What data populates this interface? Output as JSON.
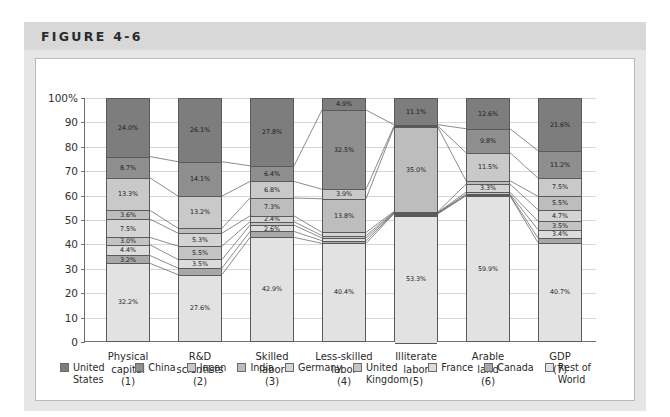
{
  "figure": {
    "title": "FIGURE 4-6"
  },
  "chart_data": {
    "type": "bar",
    "subtype": "stacked-100-percent",
    "title": "FIGURE 4-6",
    "xlabel": "",
    "ylabel": "",
    "ylim": [
      0,
      100
    ],
    "yticks": [
      "0",
      "10",
      "20",
      "30",
      "40",
      "50",
      "60",
      "70",
      "80",
      "90",
      "100%"
    ],
    "grid": true,
    "legend_position": "bottom",
    "legend": [
      "United States",
      "China",
      "Japan",
      "India",
      "Germany",
      "United Kingdom",
      "France",
      "Canada",
      "Rest of World"
    ],
    "categories": [
      "Physical capital\n(1)",
      "R&D scientists\n(2)",
      "Skilled labor\n(3)",
      "Less-skilled labor\n(4)",
      "Illiterate labor\n(5)",
      "Arable land\n(6)",
      "GDP\n(7)"
    ],
    "category_labels": [
      {
        "line1": "Physical",
        "line2": "capital",
        "num": "(1)"
      },
      {
        "line1": "R&D",
        "line2": "scientists",
        "num": "(2)"
      },
      {
        "line1": "Skilled",
        "line2": "labor",
        "num": "(3)"
      },
      {
        "line1": "Less-skilled",
        "line2": "labor",
        "num": "(4)"
      },
      {
        "line1": "Illiterate",
        "line2": "labor",
        "num": "(5)"
      },
      {
        "line1": "Arable",
        "line2": "land",
        "num": "(6)"
      },
      {
        "line1": "GDP",
        "line2": "",
        "num": "(7)"
      }
    ],
    "series": [
      {
        "name": "United States",
        "color": "#7d7d7d",
        "values": [
          24.0,
          26.1,
          27.8,
          4.9,
          11.1,
          12.6,
          21.6
        ],
        "labels": [
          "24.0%",
          "26.1%",
          "27.8%",
          "4.9%",
          "11.1%",
          "12.6%",
          "21.6%"
        ]
      },
      {
        "name": "China",
        "color": "#8f8f8f",
        "values": [
          8.7,
          14.1,
          6.4,
          32.5,
          0.6,
          9.8,
          11.2
        ],
        "labels": [
          "8.7%",
          "14.1%",
          "6.4%",
          "32.5%",
          "",
          "9.8%",
          "11.2%"
        ]
      },
      {
        "name": "Japan",
        "color": "#c9c9c9",
        "values": [
          13.3,
          13.2,
          6.8,
          3.9,
          0.5,
          11.5,
          7.5
        ],
        "labels": [
          "13.3%",
          "13.2%",
          "6.8%",
          "3.9%",
          "",
          "11.5%",
          "7.5%"
        ]
      },
      {
        "name": "India",
        "color": "#bdbdbd",
        "values": [
          3.6,
          2.0,
          7.3,
          13.8,
          35.0,
          1.4,
          5.5
        ],
        "labels": [
          "3.6%",
          "",
          "7.3%",
          "13.8%",
          "35.0%",
          "",
          "5.5%"
        ]
      },
      {
        "name": "Germany",
        "color": "#d4d4d4",
        "values": [
          7.5,
          5.3,
          2.4,
          1.3,
          0.3,
          3.3,
          4.7
        ],
        "labels": [
          "7.5%",
          "5.3%",
          "2.4%",
          "",
          "",
          "3.3%",
          "4.7%"
        ]
      },
      {
        "name": "United Kingdom",
        "color": "#c4c4c4",
        "values": [
          3.0,
          5.5,
          1.4,
          1.0,
          0.2,
          0.8,
          3.5
        ],
        "labels": [
          "3.0%",
          "5.5%",
          "",
          "",
          "",
          "",
          "3.5%"
        ]
      },
      {
        "name": "France",
        "color": "#dcdcdc",
        "values": [
          4.4,
          3.5,
          2.6,
          1.1,
          0.2,
          0.4,
          3.4
        ],
        "labels": [
          "4.4%",
          "3.5%",
          "2.6%",
          "",
          "",
          "",
          "3.4%"
        ]
      },
      {
        "name": "Canada",
        "color": "#a8a8a8",
        "values": [
          3.2,
          2.7,
          2.4,
          1.1,
          0.2,
          0.3,
          1.9
        ],
        "labels": [
          "3.2%",
          "",
          "",
          "",
          "",
          "",
          ""
        ]
      },
      {
        "name": "Rest of World",
        "color": "#e2e2e2",
        "values": [
          32.2,
          27.6,
          42.9,
          40.4,
          53.3,
          59.9,
          40.7
        ],
        "labels": [
          "32.2%",
          "27.6%",
          "42.9%",
          "40.4%",
          "53.3%",
          "59.9%",
          "40.7%"
        ]
      }
    ]
  }
}
